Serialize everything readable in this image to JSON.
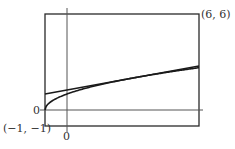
{
  "chart_data": {
    "type": "line",
    "title": "",
    "xlabel": "",
    "ylabel": "",
    "xlim": [
      -1,
      6
    ],
    "ylim": [
      -1,
      6
    ],
    "grid": false,
    "legend": null,
    "corner_labels": {
      "bottom_left": "(−1, −1)",
      "top_right": "(6, 6)"
    },
    "axis_labels": {
      "x_origin": "0",
      "y_origin": "0"
    },
    "series": [
      {
        "name": "curve",
        "description": "y = sqrt(x+1)",
        "x": [
          -1,
          -0.75,
          -0.5,
          0,
          0.5,
          1,
          2,
          3,
          4,
          5,
          6
        ],
        "y": [
          0,
          0.5,
          0.71,
          1,
          1.22,
          1.41,
          1.73,
          2,
          2.24,
          2.45,
          2.65
        ]
      },
      {
        "name": "tangent line",
        "description": "y = 2 + (x - 3)/4",
        "x": [
          -1,
          6
        ],
        "y": [
          1,
          2.75
        ]
      }
    ]
  }
}
